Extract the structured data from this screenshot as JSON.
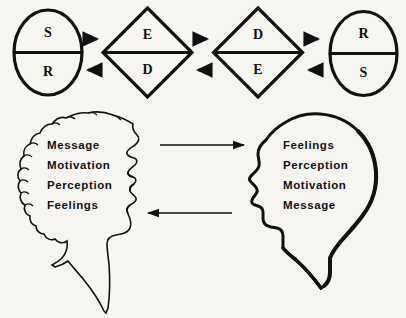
{
  "diagram": {
    "background_color": "#f6f5f2",
    "ink_color": "#111111",
    "top_row": {
      "name": "sender-receiver-encode-decode-row",
      "nodes": [
        {
          "id": "left-circle",
          "shape": "circle",
          "top_label": "S",
          "bottom_label": "R"
        },
        {
          "id": "left-diamond",
          "shape": "diamond",
          "top_label": "E",
          "bottom_label": "D"
        },
        {
          "id": "right-diamond",
          "shape": "diamond",
          "top_label": "D",
          "bottom_label": "E"
        },
        {
          "id": "right-circle",
          "shape": "circle",
          "top_label": "R",
          "bottom_label": "S"
        }
      ],
      "connectors": [
        {
          "id": "connector-1",
          "forward_direction": "right",
          "reverse_direction": "left"
        },
        {
          "id": "connector-2",
          "forward_direction": "right",
          "reverse_direction": "left"
        },
        {
          "id": "connector-3",
          "forward_direction": "right",
          "reverse_direction": "left"
        }
      ]
    },
    "bottom_row": {
      "name": "head-profiles-row",
      "left_head": {
        "id": "left-head",
        "description": "curly-haired profile facing right",
        "words": [
          "Message",
          "Motivation",
          "Perception",
          "Feelings"
        ]
      },
      "right_head": {
        "id": "right-head",
        "description": "bald profile facing left",
        "words": [
          "Feelings",
          "Perception",
          "Motivation",
          "Message"
        ]
      },
      "arrows": [
        {
          "id": "arrow-left-to-right",
          "direction": "right"
        },
        {
          "id": "arrow-right-to-left",
          "direction": "left"
        }
      ]
    }
  }
}
